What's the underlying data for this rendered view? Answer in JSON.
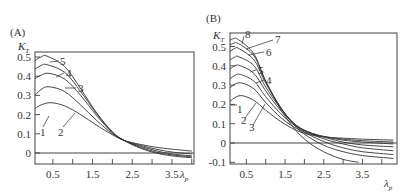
{
  "chart_data": [
    {
      "type": "line",
      "panel_label": "(A)",
      "ylabel": "K",
      "ylabel_sub": "T",
      "xlabel": "λ",
      "xlabel_sub": "p",
      "xlim": [
        0,
        4.0
      ],
      "ylim": [
        -0.05,
        0.53
      ],
      "x_ticks": [
        0.5,
        1.5,
        2.5,
        3.5
      ],
      "x_tick_labels": [
        "0.5",
        "1.5",
        "2.5",
        "3.5"
      ],
      "x_minor_ticks": [
        0.5,
        1.0,
        1.5,
        2.0,
        2.5,
        3.0,
        3.5,
        4.0
      ],
      "y_ticks": [
        0,
        0.1,
        0.2,
        0.3,
        0.4,
        0.5
      ],
      "y_tick_labels": [
        "0",
        "0.1",
        "0.2",
        "0.3",
        "0.4",
        "0.5"
      ],
      "zero_line": true,
      "grid": false,
      "series": [
        {
          "name": "1",
          "x": [
            0,
            0.2,
            0.45,
            0.8,
            1.2,
            1.6,
            2.0,
            2.3,
            2.7,
            3.1,
            3.5,
            4.0
          ],
          "y": [
            0.225,
            0.25,
            0.262,
            0.245,
            0.2,
            0.145,
            0.095,
            0.065,
            0.045,
            0.03,
            0.02,
            0.01
          ]
        },
        {
          "name": "2",
          "x": [
            0,
            0.2,
            0.4,
            0.8,
            1.2,
            1.6,
            2.0,
            2.3,
            2.7,
            3.1,
            3.5,
            4.0
          ],
          "y": [
            0.29,
            0.33,
            0.345,
            0.32,
            0.25,
            0.17,
            0.1,
            0.065,
            0.04,
            0.02,
            0.005,
            -0.005
          ]
        },
        {
          "name": "3",
          "x": [
            0,
            0.2,
            0.4,
            0.8,
            1.2,
            1.6,
            2.0,
            2.3,
            2.7,
            3.1,
            3.5,
            4.0
          ],
          "y": [
            0.38,
            0.405,
            0.415,
            0.385,
            0.3,
            0.195,
            0.105,
            0.065,
            0.035,
            0.012,
            -0.005,
            -0.015
          ]
        },
        {
          "name": "4",
          "x": [
            0,
            0.2,
            0.35,
            0.8,
            1.2,
            1.6,
            2.0,
            2.3,
            2.7,
            3.1,
            3.5,
            4.0
          ],
          "y": [
            0.43,
            0.455,
            0.46,
            0.42,
            0.32,
            0.205,
            0.108,
            0.065,
            0.03,
            0.005,
            -0.01,
            -0.02
          ]
        },
        {
          "name": "5",
          "x": [
            0,
            0.2,
            0.35,
            0.8,
            1.2,
            1.6,
            2.0,
            2.3,
            2.7,
            3.1,
            3.5,
            4.0
          ],
          "y": [
            0.475,
            0.5,
            0.505,
            0.45,
            0.335,
            0.21,
            0.11,
            0.065,
            0.025,
            0.0,
            -0.015,
            -0.025
          ]
        }
      ]
    },
    {
      "type": "line",
      "panel_label": "(B)",
      "ylabel": "K",
      "ylabel_sub": "T",
      "xlabel": "λ",
      "xlabel_sub": "p",
      "xlim": [
        0,
        4.3
      ],
      "ylim": [
        -0.1,
        0.57
      ],
      "x_ticks": [
        0.5,
        1.5,
        2.5,
        3.5
      ],
      "x_tick_labels": [
        "0.5",
        "1.5",
        "2.5",
        "3.5"
      ],
      "x_minor_ticks": [
        0.5,
        1.0,
        1.5,
        2.0,
        2.5,
        3.0,
        3.5,
        4.0
      ],
      "y_ticks": [
        -0.1,
        0,
        0.1,
        0.2,
        0.3,
        0.4,
        0.5
      ],
      "y_tick_labels": [
        "-0.1",
        "0",
        "0.1",
        "0.2",
        "0.3",
        "0.4",
        "0.5"
      ],
      "zero_line": true,
      "grid": false,
      "series": [
        {
          "name": "1",
          "x": [
            0,
            0.2,
            0.4,
            0.7,
            1.0,
            1.4,
            1.8,
            2.2,
            2.6,
            3.0,
            3.5,
            4.3
          ],
          "y": [
            0.2,
            0.235,
            0.245,
            0.22,
            0.17,
            0.11,
            0.065,
            0.04,
            0.03,
            0.025,
            0.02,
            0.015
          ]
        },
        {
          "name": "2",
          "x": [
            0,
            0.2,
            0.4,
            0.7,
            1.0,
            1.4,
            1.8,
            2.2,
            2.6,
            3.0,
            3.5,
            4.3
          ],
          "y": [
            0.27,
            0.305,
            0.31,
            0.28,
            0.21,
            0.13,
            0.075,
            0.045,
            0.03,
            0.02,
            0.012,
            0.005
          ]
        },
        {
          "name": "3",
          "x": [
            0,
            0.2,
            0.35,
            0.7,
            1.0,
            1.4,
            1.8,
            2.2,
            2.6,
            3.0,
            3.5,
            4.3
          ],
          "y": [
            0.32,
            0.35,
            0.355,
            0.32,
            0.24,
            0.15,
            0.085,
            0.05,
            0.03,
            0.015,
            0.005,
            -0.005
          ]
        },
        {
          "name": "4",
          "x": [
            0,
            0.2,
            0.35,
            0.7,
            1.0,
            1.4,
            1.8,
            2.2,
            2.6,
            3.0,
            3.5,
            4.3
          ],
          "y": [
            0.37,
            0.4,
            0.4,
            0.36,
            0.27,
            0.165,
            0.09,
            0.05,
            0.025,
            0.005,
            -0.01,
            -0.02
          ]
        },
        {
          "name": "5",
          "x": [
            0,
            0.2,
            0.3,
            0.7,
            1.0,
            1.4,
            1.8,
            2.2,
            2.6,
            3.0,
            3.5,
            4.3
          ],
          "y": [
            0.42,
            0.445,
            0.447,
            0.4,
            0.29,
            0.175,
            0.09,
            0.045,
            0.015,
            -0.005,
            -0.025,
            -0.04
          ]
        },
        {
          "name": "6",
          "x": [
            0,
            0.2,
            0.3,
            0.7,
            1.0,
            1.4,
            1.8,
            2.2,
            2.6,
            3.0,
            3.5,
            4.3
          ],
          "y": [
            0.465,
            0.49,
            0.49,
            0.43,
            0.31,
            0.18,
            0.085,
            0.035,
            0.0,
            -0.025,
            -0.045,
            -0.06
          ]
        },
        {
          "name": "7",
          "x": [
            0,
            0.15,
            0.3,
            0.7,
            1.0,
            1.4,
            1.8,
            2.2,
            2.6,
            3.0,
            3.5,
            4.3
          ],
          "y": [
            0.5,
            0.515,
            0.515,
            0.45,
            0.32,
            0.18,
            0.08,
            0.02,
            -0.02,
            -0.045,
            -0.065,
            -0.08
          ]
        },
        {
          "name": "8",
          "x": [
            0,
            0.15,
            0.3,
            0.7,
            1.0,
            1.4,
            1.8,
            2.2,
            2.6,
            3.0,
            3.4
          ],
          "y": [
            0.52,
            0.54,
            0.535,
            0.46,
            0.32,
            0.17,
            0.06,
            -0.01,
            -0.055,
            -0.085,
            -0.1
          ]
        }
      ]
    }
  ]
}
